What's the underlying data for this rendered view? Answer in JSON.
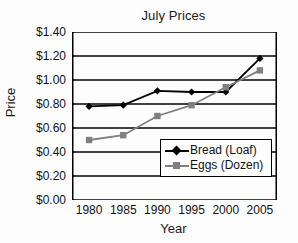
{
  "chart_data": {
    "type": "line",
    "title": "July Prices",
    "xlabel": "Year",
    "ylabel": "Price",
    "categories": [
      "1980",
      "1985",
      "1990",
      "1995",
      "2000",
      "2005"
    ],
    "x": [
      1980,
      1985,
      1990,
      1995,
      2000,
      2005
    ],
    "xlim": [
      1977.5,
      2007.5
    ],
    "ylim": [
      0.0,
      1.4
    ],
    "ytick_labels": [
      "$1.40",
      "$1.20",
      "$1.00",
      "$0.80",
      "$0.60",
      "$0.40",
      "$0.20",
      "$0.00"
    ],
    "ytick_values": [
      1.4,
      1.2,
      1.0,
      0.8,
      0.6,
      0.4,
      0.2,
      0.0
    ],
    "grid": "horizontal",
    "legend_position": "lower-right-inside",
    "series": [
      {
        "name": "Bread (Loaf)",
        "marker": "diamond",
        "color": "#000000",
        "values": [
          0.78,
          0.79,
          0.91,
          0.9,
          0.9,
          1.18
        ]
      },
      {
        "name": "Eggs (Dozen)",
        "marker": "square",
        "color": "#808080",
        "values": [
          0.5,
          0.54,
          0.7,
          0.79,
          0.94,
          1.08
        ]
      }
    ]
  },
  "colors": {
    "bread": "#000000",
    "eggs": "#808080",
    "axis": "#000000",
    "grid": "#000000",
    "background": "#ffffff"
  }
}
